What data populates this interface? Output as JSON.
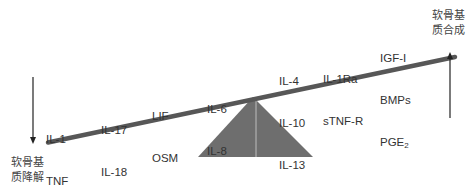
{
  "diagram": {
    "type": "seesaw-balance",
    "colors": {
      "beam": "#575757",
      "fulcrum": "#6e6e6e",
      "text": "#333333",
      "arrow": "#222222"
    },
    "left_end": {
      "label_line1": "软骨基",
      "label_line2": "质降解",
      "arrow": "down-arrow"
    },
    "right_end": {
      "label_line1": "软骨基",
      "label_line2": "质合成",
      "arrow": "up-arrow"
    },
    "groups": [
      {
        "lines": [
          "IL-1",
          "TNF"
        ]
      },
      {
        "lines": [
          "IL-17",
          "IL-18"
        ]
      },
      {
        "lines": [
          "LIF",
          "OSM"
        ]
      },
      {
        "lines": [
          "IL-6",
          "IL-8"
        ]
      },
      {
        "lines": [
          "IL-4",
          "IL-10",
          "IL-13"
        ]
      },
      {
        "lines": [
          "IL-1Ra",
          "sTNF-R"
        ]
      },
      {
        "lines": [
          "IGF-I",
          "BMPs",
          "PGE"
        ],
        "subscript_last": "2"
      }
    ]
  }
}
